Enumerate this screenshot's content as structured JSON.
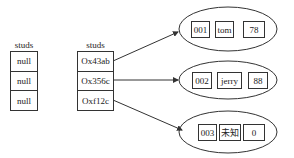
{
  "left_array": {
    "label": "studs",
    "cells": [
      "null",
      "null",
      "null"
    ]
  },
  "ref_array": {
    "label": "studs",
    "cells": [
      "Ox43ab",
      "Ox356c",
      "Oxf12c"
    ]
  },
  "objects": [
    {
      "id": "001",
      "name": "tom",
      "score": "78"
    },
    {
      "id": "002",
      "name": "jerry",
      "score": "88"
    },
    {
      "id": "003",
      "name": "未知",
      "score": "0"
    }
  ]
}
